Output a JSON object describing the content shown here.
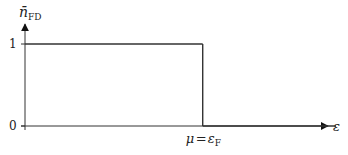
{
  "chart_data": {
    "type": "line",
    "title": "",
    "ylabel": "n̄",
    "ylabel_subscript": "FD",
    "xlabel": "ε",
    "x_tick_label": {
      "lhs": "μ",
      "eq": "=",
      "rhs": "ε",
      "rhs_subscript": "F"
    },
    "y_ticks": [
      {
        "value": 0,
        "label": "0"
      },
      {
        "value": 1,
        "label": "1"
      }
    ],
    "ylim": [
      0,
      1.25
    ],
    "xlim": [
      0,
      1.75
    ],
    "mu": 1.0,
    "series": [
      {
        "name": "step",
        "points": [
          [
            0,
            1
          ],
          [
            1,
            1
          ],
          [
            1,
            0
          ],
          [
            1.75,
            0
          ]
        ]
      }
    ],
    "grid": false,
    "legend": "none",
    "colors": {
      "line": "#333333",
      "axis": "#333333",
      "text": "#222222"
    }
  }
}
